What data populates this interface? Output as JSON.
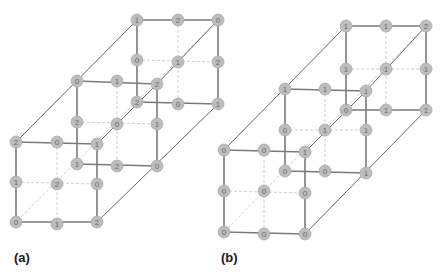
{
  "panels": [
    {
      "id": "a",
      "label": "(a)",
      "label_pos": [
        14,
        262
      ],
      "cubes": [
        {
          "name": "back",
          "nodes": [
            [
              [
                137,
                20,
                "1"
              ],
              [
                178,
                20,
                "2"
              ],
              [
                218,
                20,
                "0"
              ]
            ],
            [
              [
                137,
                60,
                "0"
              ],
              [
                178,
                62,
                "1"
              ],
              [
                218,
                62,
                "2"
              ]
            ],
            [
              [
                137,
                102,
                "2"
              ],
              [
                178,
                104,
                "0"
              ],
              [
                218,
                104,
                "1"
              ]
            ]
          ]
        },
        {
          "name": "middle",
          "nodes": [
            [
              [
                77,
                81,
                "0"
              ],
              [
                117,
                81,
                "1"
              ],
              [
                157,
                84,
                "2"
              ]
            ],
            [
              [
                77,
                122,
                "2"
              ],
              [
                117,
                124,
                "0"
              ],
              [
                157,
                124,
                "1"
              ]
            ],
            [
              [
                77,
                164,
                "1"
              ],
              [
                117,
                166,
                "2"
              ],
              [
                157,
                166,
                "0"
              ]
            ]
          ]
        },
        {
          "name": "front",
          "nodes": [
            [
              [
                16,
                142,
                "2"
              ],
              [
                57,
                142,
                "0"
              ],
              [
                97,
                144,
                "1"
              ]
            ],
            [
              [
                16,
                182,
                "1"
              ],
              [
                57,
                184,
                "2"
              ],
              [
                97,
                184,
                "0"
              ]
            ],
            [
              [
                16,
                222,
                "0"
              ],
              [
                57,
                224,
                "1"
              ],
              [
                97,
                222,
                "2"
              ]
            ]
          ]
        }
      ]
    },
    {
      "id": "b",
      "label": "(b)",
      "label_pos": [
        221,
        262
      ],
      "cubes": [
        {
          "name": "back",
          "nodes": [
            [
              [
                346,
                26,
                "1"
              ],
              [
                386,
                26,
                "1"
              ],
              [
                426,
                26,
                "2"
              ]
            ],
            [
              [
                346,
                69,
                "1"
              ],
              [
                386,
                69,
                "1"
              ],
              [
                426,
                69,
                "1"
              ]
            ],
            [
              [
                346,
                110,
                "0"
              ],
              [
                386,
                110,
                "1"
              ],
              [
                426,
                110,
                "1"
              ]
            ]
          ]
        },
        {
          "name": "middle",
          "nodes": [
            [
              [
                285,
                89,
                "1"
              ],
              [
                325,
                89,
                "1"
              ],
              [
                366,
                91,
                "1"
              ]
            ],
            [
              [
                285,
                130,
                "0"
              ],
              [
                325,
                130,
                "1"
              ],
              [
                366,
                130,
                "1"
              ]
            ],
            [
              [
                285,
                171,
                "0"
              ],
              [
                325,
                171,
                "0"
              ],
              [
                366,
                173,
                "1"
              ]
            ]
          ]
        },
        {
          "name": "front",
          "nodes": [
            [
              [
                224,
                150,
                "0"
              ],
              [
                264,
                150,
                "0"
              ],
              [
                305,
                152,
                "1"
              ]
            ],
            [
              [
                224,
                191,
                "0"
              ],
              [
                264,
                191,
                "0"
              ],
              [
                305,
                193,
                "0"
              ]
            ],
            [
              [
                224,
                232,
                "0"
              ],
              [
                264,
                234,
                "0"
              ],
              [
                305,
                234,
                "0"
              ]
            ]
          ]
        }
      ]
    }
  ],
  "colors": {
    "node_fill": "#bdbdbd",
    "edge": "#7a7a7a",
    "dashed": "#c8c8c8",
    "label": "#1a1a1a"
  }
}
